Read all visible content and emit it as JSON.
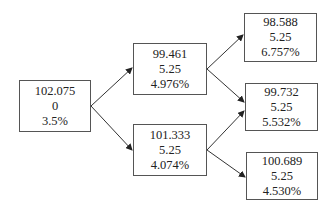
{
  "tree": {
    "root": {
      "price": "102.075",
      "coupon": "0",
      "rate": "3.5%"
    },
    "level1": [
      {
        "price": "99.461",
        "coupon": "5.25",
        "rate": "4.976%"
      },
      {
        "price": "101.333",
        "coupon": "5.25",
        "rate": "4.074%"
      }
    ],
    "level2": [
      {
        "price": "98.588",
        "coupon": "5.25",
        "rate": "6.757%"
      },
      {
        "price": "99.732",
        "coupon": "5.25",
        "rate": "5.532%"
      },
      {
        "price": "100.689",
        "coupon": "5.25",
        "rate": "4.530%"
      }
    ]
  }
}
